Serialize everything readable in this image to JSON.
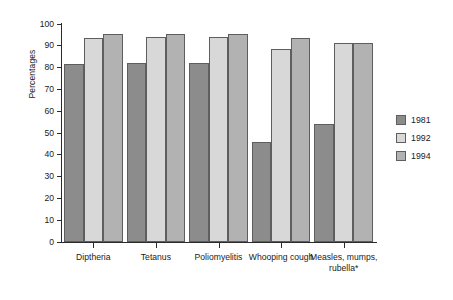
{
  "chart_data": {
    "type": "bar",
    "title": "",
    "xlabel": "",
    "ylabel": "Percentages",
    "ylim": [
      0,
      100
    ],
    "ytick_step": 10,
    "yticks": [
      "100",
      "90",
      "80",
      "70",
      "60",
      "50",
      "40",
      "30",
      "20",
      "10",
      "0"
    ],
    "grid": false,
    "legend_position": "right",
    "categories": [
      "Diptheria",
      "Tetanus",
      "Poliomyelitis",
      "Whooping cough",
      "Measles, mumps, rubella*"
    ],
    "series": [
      {
        "name": "1981",
        "color": "#8c8c8c",
        "values": [
          81.5,
          82,
          82,
          46,
          54
        ]
      },
      {
        "name": "1992",
        "color": "#d8d8d8",
        "values": [
          93.5,
          94,
          94,
          88.5,
          91.5
        ]
      },
      {
        "name": "1994",
        "color": "#b2b2b2",
        "values": [
          95.5,
          95.5,
          95.5,
          93.5,
          91.5
        ]
      }
    ]
  },
  "legend": {
    "items": [
      {
        "label": "1981",
        "color": "#8c8c8c"
      },
      {
        "label": "1992",
        "color": "#d8d8d8"
      },
      {
        "label": "1994",
        "color": "#b2b2b2"
      }
    ]
  },
  "axis": {
    "y_title": "Percentages"
  },
  "colors": {
    "axis": "#2b2b2b",
    "bar_border": "#5e5e5e",
    "background": "#ffffff",
    "text": "#1a1a1a"
  }
}
